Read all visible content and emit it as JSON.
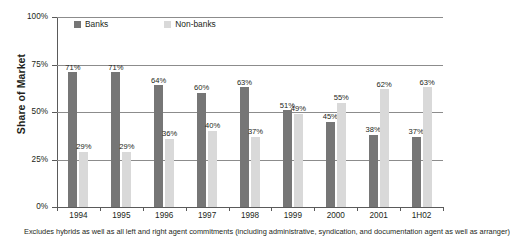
{
  "chart_data": {
    "type": "bar",
    "title": "",
    "xlabel": "",
    "ylabel": "Share of Market",
    "ylim": [
      0,
      100
    ],
    "yticks": [
      "0%",
      "25%",
      "50%",
      "75%",
      "100%"
    ],
    "grid": true,
    "legend_position": "top-inside",
    "categories": [
      "1994",
      "1995",
      "1996",
      "1997",
      "1998",
      "1999",
      "2000",
      "2001",
      "1H02"
    ],
    "series": [
      {
        "name": "Banks",
        "color": "#767676",
        "values": [
          71,
          71,
          64,
          60,
          63,
          51,
          45,
          38,
          37
        ],
        "labels": [
          "71%",
          "71%",
          "64%",
          "60%",
          "63%",
          "51%",
          "45%",
          "38%",
          "37%"
        ]
      },
      {
        "name": "Non-banks",
        "color": "#d9d9d9",
        "values": [
          29,
          29,
          36,
          40,
          37,
          49,
          55,
          62,
          63
        ],
        "labels": [
          "29%",
          "29%",
          "36%",
          "40%",
          "37%",
          "49%",
          "55%",
          "62%",
          "63%"
        ]
      }
    ],
    "annotations": [
      "Excludes hybrids as well as all left and right agent commitments (including administrative, syndication, and documentation agent as well as arranger)"
    ]
  },
  "axis": {
    "y_title": "Share of Market",
    "y_ticks": [
      {
        "label": "100%",
        "value": 100
      },
      {
        "label": "75%",
        "value": 75
      },
      {
        "label": "50%",
        "value": 50
      },
      {
        "label": "25%",
        "value": 25
      },
      {
        "label": "0%",
        "value": 0
      }
    ],
    "x_ticks": [
      "1994",
      "1995",
      "1996",
      "1997",
      "1998",
      "1999",
      "2000",
      "2001",
      "1H02"
    ]
  },
  "legend": {
    "items": [
      {
        "label": "Banks",
        "color": "#767676"
      },
      {
        "label": "Non-banks",
        "color": "#d9d9d9"
      }
    ]
  },
  "footnote": {
    "text": "Excludes hybrids as well as all left and right agent commitments (including administrative, syndication, and documentation agent as well as arranger)"
  },
  "colors": {
    "banks": "#767676",
    "non_banks": "#d9d9d9",
    "axis": "#5a5a5a",
    "grid": "#8c8c8c",
    "text": "#231f20",
    "background": "#ffffff"
  }
}
